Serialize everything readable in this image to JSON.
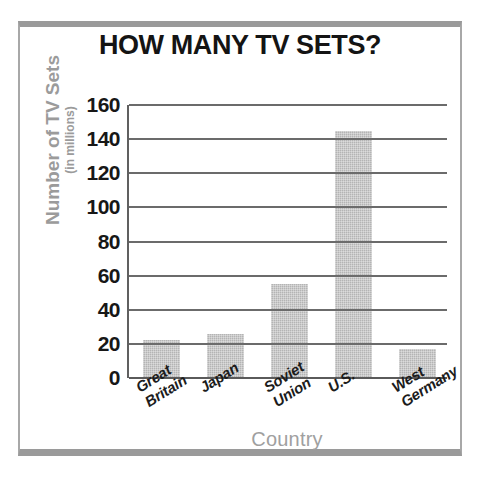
{
  "chart_data": {
    "type": "bar",
    "title": "HOW MANY TV SETS?",
    "xlabel": "Country",
    "ylabel": "Number of TV Sets",
    "ylabel_sub": "(in millions)",
    "categories": [
      "Great\nBritain",
      "Japan",
      "Soviet\nUnion",
      "U.S.",
      "West\nGermany"
    ],
    "values": [
      22,
      26,
      55,
      145,
      17
    ],
    "ylim": [
      0,
      160
    ],
    "ytick_values": [
      160,
      140,
      120,
      100,
      80,
      60,
      40,
      20,
      0
    ],
    "ytick_labels": [
      "160",
      "140",
      "120",
      "100",
      "80",
      "60",
      "40",
      "20",
      "0"
    ],
    "grid": true,
    "legend": "none",
    "bar_color": "#b4b4b4",
    "title_color": "#141414",
    "axis_label_color": "#9b9b9b",
    "tick_color": "#171717",
    "gridline_color": "#6b6b6b",
    "frame_color": "#9a9a9a"
  }
}
